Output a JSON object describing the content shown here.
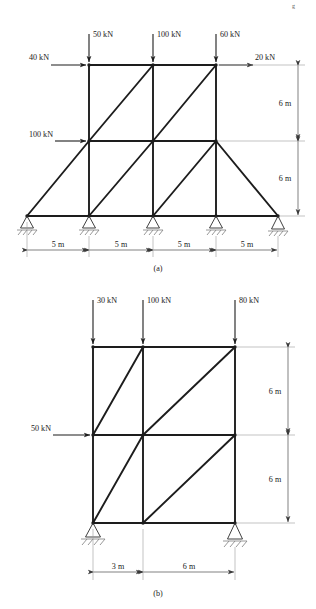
{
  "page": {
    "header_note": "g",
    "background": "#ffffff",
    "ink": "#1d1d1a"
  },
  "figures": [
    {
      "id": "figure-a",
      "caption": "(a)",
      "type": "plane-truss-frame",
      "geometry": {
        "bays_x_m": [
          5,
          5,
          5,
          5
        ],
        "stories_y_m": [
          6,
          6
        ],
        "node_x_px": [
          27,
          89,
          153,
          216,
          278
        ],
        "level_y_px": [
          65,
          141,
          216
        ]
      },
      "point_loads_vertical": [
        {
          "label": "50 kN",
          "magnitude": 50,
          "unit": "kN",
          "at_x_px": 89,
          "direction": "down"
        },
        {
          "label": "100 kN",
          "magnitude": 100,
          "unit": "kN",
          "at_x_px": 153,
          "direction": "down"
        },
        {
          "label": "60 kN",
          "magnitude": 60,
          "unit": "kN",
          "at_x_px": 216,
          "direction": "down"
        }
      ],
      "point_loads_horizontal": [
        {
          "label": "40 kN",
          "magnitude": 40,
          "unit": "kN",
          "at_y_px": 65,
          "direction": "right",
          "side": "left"
        },
        {
          "label": "20 kN",
          "magnitude": 20,
          "unit": "kN",
          "at_y_px": 65,
          "direction": "right",
          "side": "right"
        },
        {
          "label": "100 kN",
          "magnitude": 100,
          "unit": "kN",
          "at_y_px": 141,
          "direction": "right",
          "side": "left"
        }
      ],
      "horizontal_dimensions": [
        {
          "label": "5 m",
          "value": 5,
          "unit": "m"
        },
        {
          "label": "5 m",
          "value": 5,
          "unit": "m"
        },
        {
          "label": "5 m",
          "value": 5,
          "unit": "m"
        },
        {
          "label": "5 m",
          "value": 5,
          "unit": "m"
        }
      ],
      "vertical_dimensions": [
        {
          "label": "6 m",
          "value": 6,
          "unit": "m"
        },
        {
          "label": "6 m",
          "value": 6,
          "unit": "m"
        }
      ],
      "supports": [
        {
          "kind": "pin",
          "at_x_px": 27
        },
        {
          "kind": "pin",
          "at_x_px": 89
        },
        {
          "kind": "pin",
          "at_x_px": 153
        },
        {
          "kind": "pin",
          "at_x_px": 216
        },
        {
          "kind": "pin",
          "at_x_px": 278
        }
      ]
    },
    {
      "id": "figure-b",
      "caption": "(b)",
      "type": "plane-truss-frame",
      "geometry": {
        "bays_x_m": [
          3,
          6
        ],
        "stories_y_m": [
          6,
          6
        ],
        "node_x_px": [
          93,
          143,
          235
        ],
        "level_y_px": [
          347,
          435,
          523
        ]
      },
      "point_loads_vertical": [
        {
          "label": "30 kN",
          "magnitude": 30,
          "unit": "kN",
          "at_x_px": 93,
          "direction": "down"
        },
        {
          "label": "100 kN",
          "magnitude": 100,
          "unit": "kN",
          "at_x_px": 143,
          "direction": "down"
        },
        {
          "label": "80 kN",
          "magnitude": 80,
          "unit": "kN",
          "at_x_px": 235,
          "direction": "down"
        }
      ],
      "point_loads_horizontal": [
        {
          "label": "50 kN",
          "magnitude": 50,
          "unit": "kN",
          "at_y_px": 435,
          "direction": "right",
          "side": "left"
        }
      ],
      "horizontal_dimensions": [
        {
          "label": "3 m",
          "value": 3,
          "unit": "m"
        },
        {
          "label": "6 m",
          "value": 6,
          "unit": "m"
        }
      ],
      "vertical_dimensions": [
        {
          "label": "6 m",
          "value": 6,
          "unit": "m"
        },
        {
          "label": "6 m",
          "value": 6,
          "unit": "m"
        }
      ],
      "supports": [
        {
          "kind": "pin",
          "at_x_px": 93
        },
        {
          "kind": "pin",
          "at_x_px": 235
        }
      ]
    }
  ],
  "labels": {
    "fig_a_load_1": "50 kN",
    "fig_a_load_2": "100 kN",
    "fig_a_load_3": "60 kN",
    "fig_a_load_h1": "40 kN",
    "fig_a_load_h2": "20 kN",
    "fig_a_load_h3": "100 kN",
    "fig_a_dim_h1": "5 m",
    "fig_a_dim_h2": "5 m",
    "fig_a_dim_h3": "5 m",
    "fig_a_dim_h4": "5 m",
    "fig_a_dim_v1": "6 m",
    "fig_a_dim_v2": "6 m",
    "fig_a_caption": "(a)",
    "fig_b_load_1": "30 kN",
    "fig_b_load_2": "100 kN",
    "fig_b_load_3": "80 kN",
    "fig_b_load_h1": "50 kN",
    "fig_b_dim_h1": "3 m",
    "fig_b_dim_h2": "6 m",
    "fig_b_dim_v1": "6 m",
    "fig_b_dim_v2": "6 m",
    "fig_b_caption": "(b)",
    "page_header": "g"
  }
}
